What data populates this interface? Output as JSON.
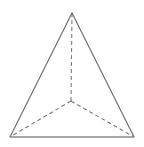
{
  "figure": {
    "name": "tetrahedron-diagram",
    "type": "geometric-solid-line-drawing",
    "shape_label": "triangular pyramid (tetrahedron)",
    "background_color": "#ffffff",
    "canvas": {
      "width": 144,
      "height": 147
    },
    "stroke": {
      "solid_color": "#6e6e6e",
      "hidden_color": "#7a7a7a",
      "base_color": "#8a8a8a",
      "solid_width": 1.15,
      "hidden_width": 1.1,
      "base_width": 1.6,
      "dash_pattern": "4,3"
    },
    "vertices": [
      {
        "id": "apex",
        "name": "apex-vertex",
        "x": 72,
        "y": 13,
        "visible": true
      },
      {
        "id": "front-left",
        "name": "front-left-vertex",
        "x": 10,
        "y": 137,
        "visible": true
      },
      {
        "id": "front-right",
        "name": "front-right-vertex",
        "x": 134,
        "y": 137,
        "visible": true
      },
      {
        "id": "back",
        "name": "back-hidden-vertex",
        "x": 71,
        "y": 101,
        "visible": false
      }
    ],
    "edges": [
      {
        "id": "apex-front-left",
        "name": "edge-apex-to-front-left",
        "from": "apex",
        "to": "front-left",
        "style": "solid"
      },
      {
        "id": "apex-front-right",
        "name": "edge-apex-to-front-right",
        "from": "apex",
        "to": "front-right",
        "style": "solid"
      },
      {
        "id": "front-base",
        "name": "edge-front-base",
        "from": "front-left",
        "to": "front-right",
        "style": "solid"
      },
      {
        "id": "apex-back",
        "name": "edge-apex-to-back",
        "from": "apex",
        "to": "back",
        "style": "dashed"
      },
      {
        "id": "back-front-left",
        "name": "edge-back-to-front-left",
        "from": "back",
        "to": "front-left",
        "style": "dashed"
      },
      {
        "id": "back-front-right",
        "name": "edge-back-to-front-right",
        "from": "back",
        "to": "front-right",
        "style": "dashed"
      }
    ],
    "labels": []
  }
}
